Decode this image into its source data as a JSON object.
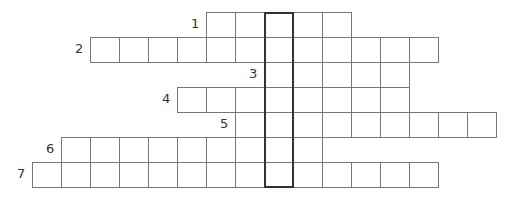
{
  "puzzle": {
    "cell_width": 29,
    "cell_height": 25,
    "origin_x": 32,
    "origin_y": 12,
    "highlight_column": 8,
    "highlight_color": "#333333",
    "border_color": "#777777",
    "rows": [
      {
        "number": "1",
        "start_col": 6,
        "length": 5
      },
      {
        "number": "2",
        "start_col": 2,
        "length": 12
      },
      {
        "number": "3",
        "start_col": 8,
        "length": 5
      },
      {
        "number": "4",
        "start_col": 5,
        "length": 8
      },
      {
        "number": "5",
        "start_col": 7,
        "length": 9
      },
      {
        "number": "6",
        "start_col": 1,
        "length": 9
      },
      {
        "number": "7",
        "start_col": 0,
        "length": 14
      }
    ]
  }
}
